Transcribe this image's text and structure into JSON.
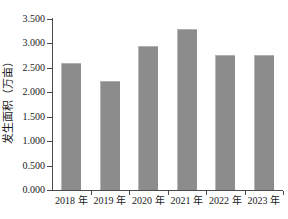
{
  "chart_data": {
    "type": "bar",
    "title": "",
    "subtitle": "",
    "xlabel": "",
    "ylabel": "发生面积（万亩）",
    "categories": [
      "2018 年",
      "2019 年",
      "2020 年",
      "2021 年",
      "2022 年",
      "2023 年"
    ],
    "values": [
      2.6,
      2.24,
      2.95,
      3.3,
      2.76,
      2.76
    ],
    "series": [
      {
        "name": "发生面积",
        "values": [
          2.6,
          2.24,
          2.95,
          3.3,
          2.76,
          2.76
        ]
      }
    ],
    "ylim": [
      0.0,
      3.5
    ],
    "ytick_values": [
      3.5,
      3.0,
      2.5,
      2.0,
      1.5,
      1.0,
      0.5,
      0.0
    ],
    "ytick_labels": [
      "3.500",
      "3.000",
      "2.500",
      "2.000",
      "1.500",
      "1.000",
      "0.500",
      "0.000"
    ],
    "grid": false,
    "legend": null,
    "legend_position": "none",
    "annotations": [],
    "bar_color": "#8c8c8c",
    "axis_color": "#4a4a4a",
    "background_color": "#ffffff",
    "text_color": "#1a1a1a"
  }
}
